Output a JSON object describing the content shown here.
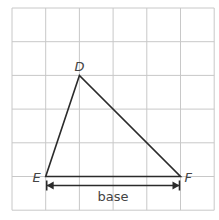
{
  "diagram": {
    "grid": {
      "columns": 6,
      "rows": 6
    },
    "vertices": [
      {
        "name": "D",
        "col": 2,
        "row": 2
      },
      {
        "name": "E",
        "col": 1,
        "row": 5
      },
      {
        "name": "F",
        "col": 5,
        "row": 5
      }
    ],
    "base_label": "base",
    "colors": {
      "grid": "#c8c8c8",
      "lines": "#2b2b2b",
      "text": "#444444"
    }
  }
}
